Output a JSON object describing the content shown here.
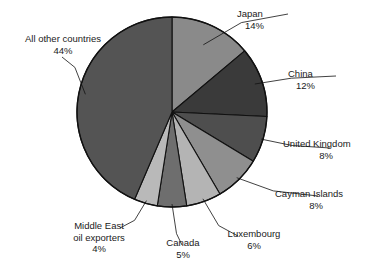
{
  "chart_data": {
    "type": "pie",
    "title": "",
    "subtitle": "",
    "xlabel": "",
    "ylabel": "",
    "legend_position": "none",
    "grid": false,
    "start_angle_deg": 0,
    "direction": "clockwise",
    "units": "percent",
    "categories": [
      "Japan",
      "China",
      "United Kingdom",
      "Cayman Islands",
      "Luxembourg",
      "Canada",
      "Middle East oil exporters",
      "All other countries"
    ],
    "values": [
      14,
      12,
      8,
      8,
      6,
      5,
      4,
      44
    ],
    "value_labels": [
      "14%",
      "12%",
      "8%",
      "8%",
      "6%",
      "5%",
      "4%",
      "44%"
    ],
    "colors": [
      "#8a8a8a",
      "#3a3a3a",
      "#4e4e4e",
      "#8f8f8f",
      "#b4b4b4",
      "#6e6e6e",
      "#b9b9b9",
      "#545454"
    ],
    "slices": [
      {
        "name": "Japan",
        "value": 14,
        "value_label": "14%",
        "color": "#8a8a8a",
        "label_line1": "Japan",
        "label_line2": "14%"
      },
      {
        "name": "China",
        "value": 12,
        "value_label": "12%",
        "color": "#3a3a3a",
        "label_line1": "China",
        "label_line2": "12%"
      },
      {
        "name": "United Kingdom",
        "value": 8,
        "value_label": "8%",
        "color": "#4e4e4e",
        "label_line1": "United Kingdom",
        "label_line2": "8%"
      },
      {
        "name": "Cayman Islands",
        "value": 8,
        "value_label": "8%",
        "color": "#8f8f8f",
        "label_line1": "Cayman Islands",
        "label_line2": "8%"
      },
      {
        "name": "Luxembourg",
        "value": 6,
        "value_label": "6%",
        "color": "#b4b4b4",
        "label_line1": "Luxembourg",
        "label_line2": "6%"
      },
      {
        "name": "Canada",
        "value": 5,
        "value_label": "5%",
        "color": "#6e6e6e",
        "label_line1": "Canada",
        "label_line2": "5%"
      },
      {
        "name": "Middle East oil exporters",
        "value": 4,
        "value_label": "4%",
        "color": "#b9b9b9",
        "label_line1": "Middle East",
        "label_line2": "oil exporters",
        "label_line3": "4%"
      },
      {
        "name": "All other countries",
        "value": 44,
        "value_label": "44%",
        "color": "#545454",
        "label_line1": "All other countries",
        "label_line2": "44%"
      }
    ],
    "geometry": {
      "center_x": 172,
      "center_y": 112,
      "radius": 95,
      "outline_color": "#111111",
      "background": "#ffffff"
    }
  }
}
